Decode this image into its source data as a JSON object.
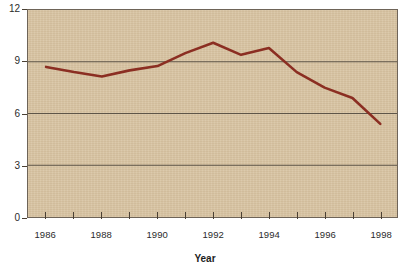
{
  "chart_data": {
    "type": "line",
    "title": "",
    "subtitle": "",
    "xlabel": "Year",
    "ylabel": "",
    "x": [
      1986,
      1987,
      1988,
      1989,
      1990,
      1991,
      1992,
      1993,
      1994,
      1995,
      1996,
      1997,
      1998
    ],
    "values": [
      8.7,
      8.4,
      8.15,
      8.5,
      8.75,
      9.5,
      10.1,
      9.4,
      9.8,
      8.4,
      7.5,
      6.9,
      5.4
    ],
    "series": [
      {
        "name": "",
        "values": [
          8.7,
          8.4,
          8.15,
          8.5,
          8.75,
          9.5,
          10.1,
          9.4,
          9.8,
          8.4,
          7.5,
          6.9,
          5.4
        ]
      }
    ],
    "xlim": [
      1985.35,
      1998.6
    ],
    "ylim": [
      0,
      12
    ],
    "yticks": [
      0,
      3,
      6,
      9,
      12
    ],
    "ytick_labels": [
      "0",
      "3",
      "6",
      "9",
      "12"
    ],
    "xticks": [
      1986,
      1987,
      1988,
      1989,
      1990,
      1991,
      1992,
      1993,
      1994,
      1995,
      1996,
      1997,
      1998
    ],
    "xtick_labels_shown": [
      "1986",
      "1988",
      "1990",
      "1992",
      "1994",
      "1996",
      "1998"
    ],
    "xtick_labels_shown_at": [
      1986,
      1988,
      1990,
      1992,
      1994,
      1996,
      1998
    ],
    "grid": true,
    "grid_axis": "y",
    "legend": false,
    "legend_position": "none",
    "colors": {
      "line": "#8b2e22",
      "plot_background": "#d8c4a3",
      "grid": "#5d5448",
      "frame": "#6e6458",
      "page_background": "#ffffff",
      "text": "#2b2b2b"
    }
  },
  "axis": {
    "y_labels": [
      "12",
      "9",
      "6",
      "3",
      "0"
    ],
    "x_labels": [
      "1986",
      "1988",
      "1990",
      "1992",
      "1994",
      "1996",
      "1998"
    ],
    "x_title": "Year"
  }
}
